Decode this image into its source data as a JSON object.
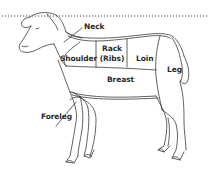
{
  "diagram": {
    "labels": {
      "neck": "Neck",
      "shoulder": "Shoulder",
      "rack_line1": "Rack",
      "rack_line2": "(Ribs)",
      "loin": "Loin",
      "leg": "Leg",
      "breast": "Breast",
      "foreleg": "Foreleg"
    },
    "colors": {
      "line": "#3a3a3a",
      "text": "#2a2a2a",
      "dotted_rule": "#4a4a4a",
      "background": "#ffffff"
    }
  }
}
